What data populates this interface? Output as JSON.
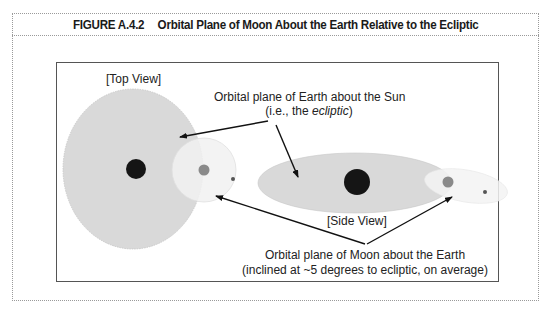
{
  "figure": {
    "number": "FIGURE A.4.2",
    "title": "Orbital Plane of Moon About the Earth Relative to the Ecliptic"
  },
  "labels": {
    "top_view": "[Top View]",
    "side_view": "[Side View]",
    "earth_plane_line1": "Orbital plane of Earth about the Sun",
    "earth_plane_line2_prefix": "(i.e., the ",
    "earth_plane_line2_italic": "ecliptic",
    "earth_plane_line2_suffix": ")",
    "moon_plane_line1": "Orbital plane of Moon about the Earth",
    "moon_plane_line2": "(inclined at ~5 degrees to ecliptic, on average)"
  },
  "colors": {
    "ecliptic_fill": "#d9d9d9",
    "moon_orbit_fill": "#f1f1f1",
    "sun": "#151515",
    "earth": "#8a8a8a",
    "moon": "#555555",
    "arrow": "#111111",
    "frame": "#9a9a9a"
  },
  "elements": {
    "sun": "sun-icon",
    "earth": "earth-icon",
    "moon": "moon-icon"
  }
}
